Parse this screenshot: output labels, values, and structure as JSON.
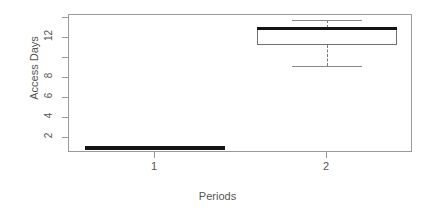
{
  "chart_data": {
    "type": "box",
    "title": "",
    "xlabel": "Periods",
    "ylabel": "Access Days",
    "categories": [
      "1",
      "2"
    ],
    "xtick_labels": [
      "1",
      "2"
    ],
    "ytick_labels": [
      "2",
      "4",
      "6",
      "8",
      "12"
    ],
    "ytick_values": [
      2,
      4,
      6,
      8,
      12
    ],
    "ylim": [
      0.5,
      14.3
    ],
    "xlim": [
      0.5,
      2.5
    ],
    "grid": false,
    "legend": null,
    "box_color": "#6f6f6f",
    "median_color": "#141414",
    "whisker_color": "#8a8a8a",
    "frame_color": "#9a9a9a",
    "text_color": "#555555",
    "boxes": [
      {
        "category": "1",
        "label": "1",
        "min": 1,
        "q1": 1,
        "median": 1,
        "q3": 1,
        "max": 1,
        "degenerate": true,
        "outliers": []
      },
      {
        "category": "2",
        "label": "2",
        "min": 9.2,
        "q1": 11.3,
        "median": 13,
        "q3": 13,
        "max": 13.8,
        "degenerate": false,
        "outliers": []
      }
    ]
  },
  "axes": {
    "y_title": "Access Days",
    "x_title": "Periods"
  }
}
